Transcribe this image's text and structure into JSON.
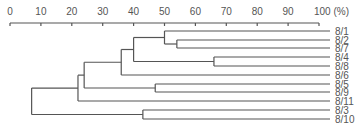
{
  "chart_data": {
    "type": "dendrogram",
    "title": "",
    "xlabel": "",
    "x_unit": "(%)",
    "xlim": [
      0,
      100
    ],
    "x_ticks": [
      0,
      10,
      20,
      30,
      40,
      50,
      60,
      70,
      80,
      90,
      100
    ],
    "tick_labels": [
      "0",
      "10",
      "20",
      "30",
      "40",
      "50",
      "60",
      "70",
      "80",
      "90",
      "100 (%)"
    ],
    "leaves": [
      "8/1",
      "8/2",
      "8/7",
      "8/4",
      "8/8",
      "8/6",
      "8/5",
      "8/9",
      "8/11",
      "8/3",
      "8/10"
    ],
    "merges": [
      {
        "children": [
          "8/2",
          "8/7"
        ],
        "similarity": 54
      },
      {
        "children": [
          "8/4",
          "8/8"
        ],
        "similarity": 66
      },
      {
        "children": [
          "8/1",
          "(8/2,8/7)"
        ],
        "similarity": 50
      },
      {
        "children": [
          "(8/1,8/2,8/7)",
          "(8/4,8/8)"
        ],
        "similarity": 40
      },
      {
        "children": [
          "(...)",
          "8/6"
        ],
        "similarity": 36
      },
      {
        "children": [
          "8/5",
          "8/9"
        ],
        "similarity": 47
      },
      {
        "children": [
          "(...8/6)",
          "(8/5,8/9)"
        ],
        "similarity": 24
      },
      {
        "children": [
          "(...)",
          "8/11"
        ],
        "similarity": 22
      },
      {
        "children": [
          "8/3",
          "8/10"
        ],
        "similarity": 43
      },
      {
        "children": [
          "(...8/11)",
          "(8/3,8/10)"
        ],
        "similarity": 7
      }
    ],
    "grid": false
  }
}
